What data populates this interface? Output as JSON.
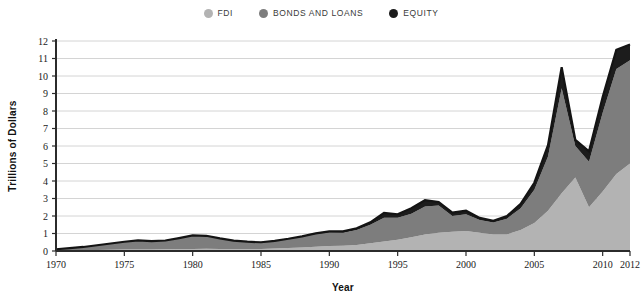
{
  "legend": {
    "position": "top-center",
    "items": [
      {
        "label": "FDI",
        "color": "#b3b3b3",
        "key": "fdi"
      },
      {
        "label": "BONDS AND LOANS",
        "color": "#7d7d7d",
        "key": "bonds_and_loans"
      },
      {
        "label": "EQUITY",
        "color": "#1c1c1c",
        "key": "equity"
      }
    ]
  },
  "chart_data": {
    "type": "area",
    "stacked": true,
    "title": "",
    "subtitle": "",
    "xlabel": "Year",
    "ylabel": "Trillions of Dollars",
    "xlim": [
      1970,
      2012
    ],
    "ylim": [
      0,
      12
    ],
    "grid": true,
    "grid_axis": "y",
    "x_tick_labels": [
      "1970",
      "1975",
      "1980",
      "1985",
      "1990",
      "1995",
      "2000",
      "2005",
      "2010",
      "2012"
    ],
    "x_tick_values": [
      1970,
      1975,
      1980,
      1985,
      1990,
      1995,
      2000,
      2005,
      2010,
      2012
    ],
    "y_tick_labels": [
      "0",
      "1",
      "2",
      "3",
      "4",
      "5",
      "6",
      "7",
      "8",
      "9",
      "10",
      "11",
      "12"
    ],
    "y_tick_values": [
      0,
      1,
      2,
      3,
      4,
      5,
      6,
      7,
      8,
      9,
      10,
      11,
      12
    ],
    "x": [
      1970,
      1971,
      1972,
      1973,
      1974,
      1975,
      1976,
      1977,
      1978,
      1979,
      1980,
      1981,
      1982,
      1983,
      1984,
      1985,
      1986,
      1987,
      1988,
      1989,
      1990,
      1991,
      1992,
      1993,
      1994,
      1995,
      1996,
      1997,
      1998,
      1999,
      2000,
      2001,
      2002,
      2003,
      2004,
      2005,
      2006,
      2007,
      2008,
      2009,
      2010,
      2011,
      2012
    ],
    "series": [
      {
        "name": "FDI",
        "key": "fdi",
        "color": "#b3b3b3",
        "values": [
          0.03,
          0.04,
          0.05,
          0.06,
          0.07,
          0.08,
          0.09,
          0.09,
          0.1,
          0.11,
          0.12,
          0.13,
          0.12,
          0.11,
          0.11,
          0.12,
          0.14,
          0.17,
          0.2,
          0.24,
          0.28,
          0.3,
          0.35,
          0.45,
          0.55,
          0.65,
          0.78,
          0.95,
          1.05,
          1.1,
          1.15,
          1.05,
          0.95,
          0.95,
          1.2,
          1.6,
          2.3,
          3.3,
          4.2,
          2.5,
          3.4,
          4.4,
          5.0
        ]
      },
      {
        "name": "Bonds and loans",
        "key": "bonds_and_loans",
        "color": "#7d7d7d",
        "values": [
          0.07,
          0.12,
          0.18,
          0.27,
          0.36,
          0.45,
          0.52,
          0.48,
          0.5,
          0.63,
          0.75,
          0.72,
          0.58,
          0.46,
          0.4,
          0.36,
          0.42,
          0.5,
          0.6,
          0.72,
          0.78,
          0.75,
          0.85,
          1.05,
          1.35,
          1.25,
          1.35,
          1.6,
          1.55,
          0.9,
          0.95,
          0.72,
          0.68,
          0.9,
          1.25,
          1.9,
          3.1,
          6.0,
          1.8,
          2.6,
          4.5,
          6.0,
          5.9
        ]
      },
      {
        "name": "Equity",
        "key": "equity",
        "color": "#1c1c1c",
        "values": [
          0.0,
          0.0,
          0.0,
          0.0,
          0.0,
          0.0,
          0.0,
          0.0,
          0.0,
          0.0,
          0.02,
          0.02,
          0.02,
          0.02,
          0.02,
          0.02,
          0.02,
          0.03,
          0.04,
          0.05,
          0.06,
          0.07,
          0.1,
          0.14,
          0.28,
          0.2,
          0.32,
          0.35,
          0.2,
          0.2,
          0.2,
          0.12,
          0.1,
          0.15,
          0.25,
          0.4,
          0.65,
          1.2,
          0.35,
          0.6,
          0.9,
          1.1,
          0.9
        ]
      }
    ],
    "totals": [
      0.1,
      0.16,
      0.23,
      0.33,
      0.43,
      0.53,
      0.61,
      0.57,
      0.6,
      0.74,
      0.89,
      0.87,
      0.72,
      0.59,
      0.53,
      0.5,
      0.58,
      0.7,
      0.84,
      1.01,
      1.12,
      1.12,
      1.3,
      1.64,
      2.18,
      2.1,
      2.45,
      2.9,
      2.8,
      2.2,
      2.3,
      1.89,
      1.73,
      2.0,
      2.7,
      3.9,
      6.05,
      10.5,
      6.35,
      5.7,
      8.8,
      11.5,
      11.8
    ],
    "annotations": []
  }
}
